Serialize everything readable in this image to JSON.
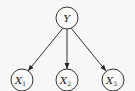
{
  "diagram": {
    "type": "directed-graph",
    "nodes": [
      {
        "id": "Y",
        "label": "Y",
        "sub": "",
        "cx": 67,
        "cy": 18
      },
      {
        "id": "X1",
        "label": "X",
        "sub": "1",
        "cx": 22,
        "cy": 80
      },
      {
        "id": "X2",
        "label": "X",
        "sub": "2",
        "cx": 67,
        "cy": 80
      },
      {
        "id": "X3",
        "label": "X",
        "sub": "3",
        "cx": 113,
        "cy": 80
      }
    ],
    "edges": [
      {
        "from": "Y",
        "to": "X1"
      },
      {
        "from": "Y",
        "to": "X2"
      },
      {
        "from": "Y",
        "to": "X3"
      }
    ],
    "colors": {
      "stroke": "#333333",
      "background": "#f7f7f5"
    }
  }
}
